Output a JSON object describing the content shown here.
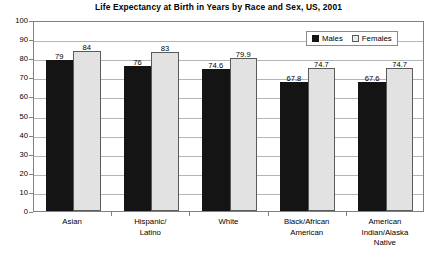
{
  "chart_data": {
    "type": "bar",
    "title": "Life Expectancy at Birth in Years by Race and Sex, US, 2001",
    "xlabel": "",
    "ylabel": "",
    "ylim": [
      0,
      100
    ],
    "yticks": [
      0,
      10,
      20,
      30,
      40,
      50,
      60,
      70,
      80,
      90,
      100
    ],
    "grid": true,
    "legend_position": "top-right",
    "categories": [
      "Asian",
      "Hispanic/\nLatino",
      "White",
      "Black/African\nAmerican",
      "American\nIndian/Alaska\nNative"
    ],
    "category_lines": [
      [
        "Asian"
      ],
      [
        "Hispanic/",
        "Latino"
      ],
      [
        "White"
      ],
      [
        "Black/African",
        "American"
      ],
      [
        "American",
        "Indian/Alaska",
        "Native"
      ]
    ],
    "series": [
      {
        "name": "Males",
        "color": "#141414",
        "values": [
          79,
          76,
          74.6,
          67.8,
          67.6
        ],
        "labels": [
          "79",
          "76",
          "74.6",
          "67.8",
          "67.6"
        ]
      },
      {
        "name": "Females",
        "color": "#e2e2e2",
        "values": [
          84,
          83,
          79.9,
          74.7,
          74.7
        ],
        "labels": [
          "84",
          "83",
          "79.9",
          "74.7",
          "74.7"
        ]
      }
    ]
  },
  "legend": {
    "entries": [
      {
        "label": "Males"
      },
      {
        "label": "Females"
      }
    ]
  },
  "axis": {
    "y_tick_labels": [
      "100",
      "90",
      "80",
      "70",
      "60",
      "50",
      "40",
      "30",
      "20",
      "10",
      "0"
    ]
  },
  "colors": {
    "males_fill": "#141414",
    "females_fill": "#e2e2e2",
    "females_stroke": "#5a5a5a",
    "gridline": "#b5b5b5",
    "frame": "#808080",
    "background": "#ffffff",
    "text": "#000000"
  }
}
